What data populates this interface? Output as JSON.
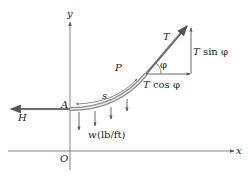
{
  "diagram": {
    "axes": {
      "x_label": "x",
      "y_label": "y",
      "origin_label": "O"
    },
    "points": {
      "A": "A",
      "P": "P"
    },
    "arc_label": "s",
    "forces": {
      "horizontal_tension": "H",
      "tension": "T",
      "angle": "φ",
      "t_cos_T": "T",
      "t_cos_rest": "cos φ",
      "t_sin_T": "T",
      "t_sin_rest": "sin φ",
      "load_w": "w",
      "load_units": "(lb/ft)"
    },
    "colors": {
      "axis": "#555555",
      "cable": "#6e6e6e",
      "cable_highlight": "#d9d9d9",
      "arrows": "#666666",
      "text": "#222222"
    }
  }
}
